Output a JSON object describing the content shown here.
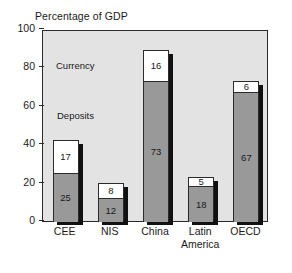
{
  "chart_data": {
    "type": "bar",
    "subtype": "stacked-bar",
    "title": "Percentage of GDP",
    "xlabel": "",
    "ylabel": "",
    "ylim": [
      0,
      100
    ],
    "yticks": [
      0,
      20,
      40,
      60,
      80,
      100
    ],
    "ytick_labels": [
      "0",
      "20",
      "40",
      "60",
      "80",
      "100"
    ],
    "grid": false,
    "legend": "inline-annotations",
    "categories": [
      "CEE",
      "NIS",
      "China",
      "Latin America",
      "OECD"
    ],
    "category_lines": [
      [
        "CEE"
      ],
      [
        "NIS"
      ],
      [
        "China"
      ],
      [
        "Latin",
        "America"
      ],
      [
        "OECD"
      ]
    ],
    "series": [
      {
        "name": "Deposits",
        "color": "#999999",
        "values": [
          25,
          12,
          73,
          18,
          67
        ]
      },
      {
        "name": "Currency",
        "color": "#ffffff",
        "values": [
          17,
          8,
          16,
          5,
          6
        ]
      }
    ],
    "totals": [
      42,
      20,
      89,
      23,
      73
    ],
    "annotations": [
      {
        "text": "Currency",
        "x_px": 56,
        "y_px": 60
      },
      {
        "text": "Deposits",
        "x_px": 57,
        "y_px": 110
      }
    ]
  },
  "colors": {
    "plot_background": "#e3e3e3",
    "page_background": "#ffffff",
    "axis": "#2b2b2b",
    "text": "#1a1a1a",
    "deposits": "#999999",
    "currency": "#ffffff",
    "shadow": "#111111"
  }
}
